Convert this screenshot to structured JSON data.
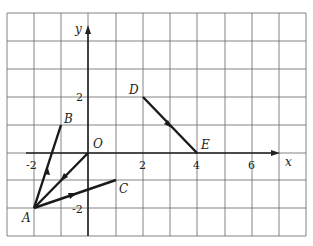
{
  "diagram": {
    "type": "coordinate-plane-vectors",
    "axes": {
      "x_label": "x",
      "y_label": "y",
      "origin_label": "O"
    },
    "x_ticks": [
      {
        "value": -2,
        "label": "-2"
      },
      {
        "value": 2,
        "label": "2"
      },
      {
        "value": 4,
        "label": "4"
      },
      {
        "value": 6,
        "label": "6"
      }
    ],
    "y_ticks": [
      {
        "value": 2,
        "label": "2"
      },
      {
        "value": -2,
        "label": "-2"
      }
    ],
    "points": {
      "A": {
        "label": "A",
        "x": -2,
        "y": -2
      },
      "B": {
        "label": "B",
        "x": -1,
        "y": 1
      },
      "C": {
        "label": "C",
        "x": 1,
        "y": -1
      },
      "D": {
        "label": "D",
        "x": 2,
        "y": 2
      },
      "E": {
        "label": "E",
        "x": 4,
        "y": 0
      },
      "O": {
        "label": "O",
        "x": 0,
        "y": 0
      }
    },
    "vectors": [
      {
        "name": "AB",
        "from": "A",
        "to": "B",
        "arrow": "A to B"
      },
      {
        "name": "OA",
        "from": "O",
        "to": "A",
        "arrow": "O to A"
      },
      {
        "name": "AC",
        "from": "A",
        "to": "C",
        "arrow": "A to C"
      },
      {
        "name": "DE",
        "from": "D",
        "to": "E",
        "arrow": "D to E"
      }
    ],
    "colors": {
      "grid": "#555555",
      "vector": "#1a1a1a",
      "background": "#ffffff"
    }
  }
}
